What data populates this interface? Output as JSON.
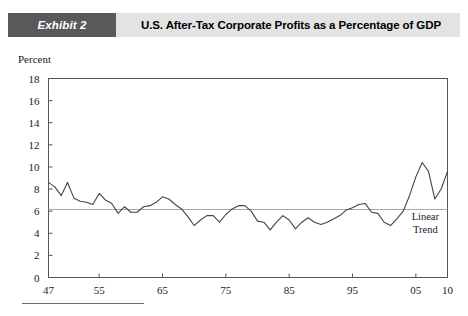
{
  "header": {
    "badge_label": "Exhibit 2",
    "title": "U.S. After-Tax Corporate Profits as a Percentage of GDP",
    "badge_color": "#58595b",
    "bar_color": "#e3e3e3"
  },
  "chart_data": {
    "type": "line",
    "title": "U.S. After-Tax Corporate Profits as a Percentage of GDP",
    "xlabel": "",
    "ylabel": "Percent",
    "ylim": [
      0,
      18
    ],
    "xlim": [
      1947,
      2010
    ],
    "ytick_labels": [
      "18",
      "16",
      "14",
      "12",
      "10",
      "8",
      "6",
      "4",
      "2",
      "0"
    ],
    "ytick_values": [
      18,
      16,
      14,
      12,
      10,
      8,
      6,
      4,
      2,
      0
    ],
    "xtick_labels": [
      "47",
      "55",
      "65",
      "75",
      "85",
      "95",
      "05",
      "10"
    ],
    "xtick_values": [
      1947,
      1955,
      1965,
      1975,
      1985,
      1995,
      2005,
      2010
    ],
    "grid": false,
    "legend": "none",
    "line_color": "#444444",
    "trend_color": "#a8a8a8",
    "annotations": [
      {
        "text_line1": "Linear",
        "text_line2": "Trend",
        "x": 2006.5,
        "y": 5.2
      }
    ],
    "series": [
      {
        "name": "After-Tax Corporate Profits (% of GDP)",
        "x": [
          1947,
          1948,
          1949,
          1950,
          1951,
          1952,
          1953,
          1954,
          1955,
          1956,
          1957,
          1958,
          1959,
          1960,
          1961,
          1962,
          1963,
          1964,
          1965,
          1966,
          1967,
          1968,
          1969,
          1970,
          1971,
          1972,
          1973,
          1974,
          1975,
          1976,
          1977,
          1978,
          1979,
          1980,
          1981,
          1982,
          1983,
          1984,
          1985,
          1986,
          1987,
          1988,
          1989,
          1990,
          1991,
          1992,
          1993,
          1994,
          1995,
          1996,
          1997,
          1998,
          1999,
          2000,
          2001,
          2002,
          2003,
          2004,
          2005,
          2006,
          2007,
          2008,
          2009,
          2010
        ],
        "values": [
          8.6,
          8.2,
          7.4,
          8.6,
          7.2,
          6.9,
          6.8,
          6.6,
          7.6,
          7.0,
          6.7,
          5.8,
          6.4,
          5.9,
          5.9,
          6.4,
          6.5,
          6.8,
          7.3,
          7.1,
          6.6,
          6.2,
          5.5,
          4.7,
          5.2,
          5.6,
          5.6,
          5.0,
          5.7,
          6.2,
          6.5,
          6.5,
          6.0,
          5.1,
          5.0,
          4.3,
          5.0,
          5.6,
          5.2,
          4.4,
          5.0,
          5.4,
          5.0,
          4.8,
          5.0,
          5.3,
          5.6,
          6.1,
          6.3,
          6.6,
          6.7,
          5.9,
          5.8,
          5.0,
          4.7,
          5.3,
          6.0,
          7.4,
          9.1,
          10.4,
          9.6,
          7.1,
          8.0,
          9.6
        ]
      },
      {
        "name": "Linear Trend",
        "x": [
          1947,
          2010
        ],
        "values": [
          6.15,
          6.15
        ]
      }
    ]
  }
}
